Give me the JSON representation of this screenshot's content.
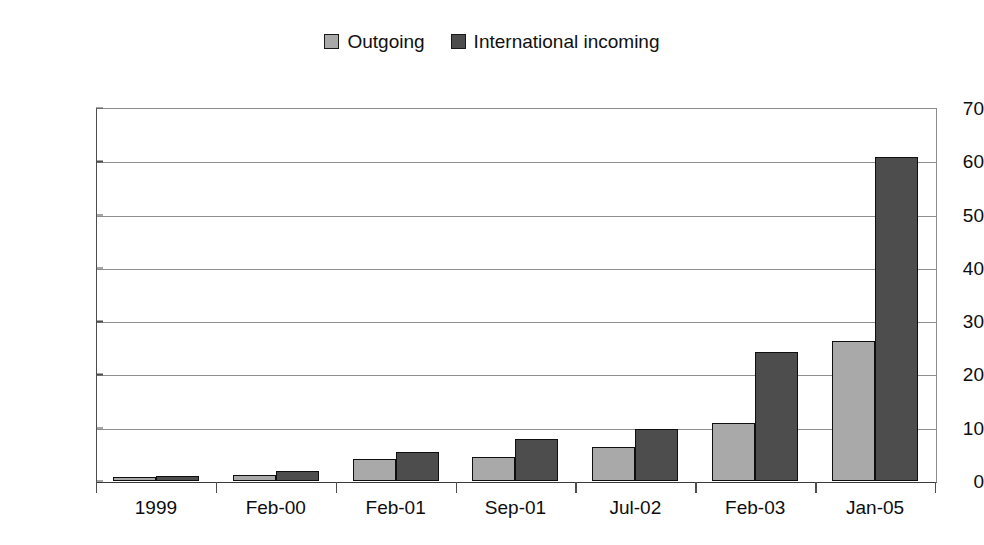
{
  "chart_data": {
    "type": "bar",
    "title": "",
    "subtitle": "",
    "xlabel": "",
    "ylabel": "",
    "categories": [
      "1999",
      "Feb-00",
      "Feb-01",
      "Sep-01",
      "Jul-02",
      "Feb-03",
      "Jan-05"
    ],
    "series": [
      {
        "name": "Outgoing",
        "color": "#a9a9a9",
        "values": [
          0.7,
          1.2,
          4.2,
          4.5,
          6.4,
          10.9,
          26.3
        ]
      },
      {
        "name": "International incoming",
        "color": "#4d4d4d",
        "values": [
          0.9,
          1.9,
          5.4,
          7.9,
          9.7,
          24.3,
          60.8
        ]
      }
    ],
    "ylim": [
      0,
      70
    ],
    "yticks": [
      0,
      10,
      20,
      30,
      40,
      50,
      60,
      70
    ],
    "ytick_labels": [
      "0",
      "10",
      "20",
      "30",
      "40",
      "50",
      "60",
      "70"
    ],
    "grid": true,
    "grid_axis": "y",
    "legend_position": "top-center",
    "bar_outline_color": "#0f0f0f",
    "axis_color": "#4d4d4d",
    "gridline_color": "#8f8f8f",
    "background": "#ffffff"
  },
  "legend": {
    "entries": [
      {
        "label": "Outgoing",
        "color": "#a9a9a9"
      },
      {
        "label": "International incoming",
        "color": "#4d4d4d"
      }
    ]
  }
}
